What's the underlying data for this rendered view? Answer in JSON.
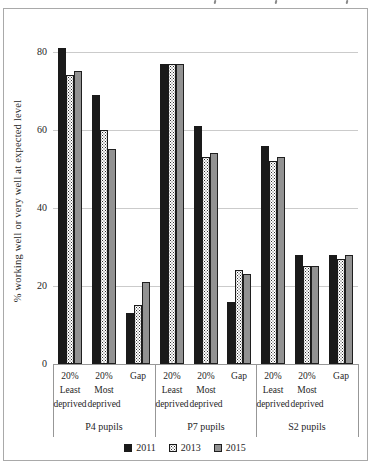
{
  "chart_data": {
    "type": "bar",
    "title": "",
    "ylabel": "% working well or very well at expected level",
    "xlabel": "",
    "y_axis": {
      "ticks": [
        0,
        20,
        40,
        60,
        80
      ],
      "ylim": [
        0,
        85
      ],
      "grid": true
    },
    "groups": [
      {
        "label": "P4 pupils"
      },
      {
        "label": "P7 pupils"
      },
      {
        "label": "S2 pupils"
      }
    ],
    "categories": [
      "20% Least deprived",
      "20% Most deprived",
      "Gap"
    ],
    "category_label_lines": [
      [
        "20%",
        "Least",
        "deprived"
      ],
      [
        "20%",
        "Most",
        "deprived"
      ],
      [
        "Gap"
      ]
    ],
    "series": [
      {
        "name": "2011",
        "fill": "solid-black",
        "values": [
          [
            81,
            69,
            13
          ],
          [
            77,
            61,
            16
          ],
          [
            56,
            28,
            28
          ]
        ]
      },
      {
        "name": "2013",
        "fill": "dotted-white",
        "values": [
          [
            74,
            60,
            15
          ],
          [
            77,
            53,
            24
          ],
          [
            52,
            25,
            27
          ]
        ]
      },
      {
        "name": "2015",
        "fill": "solid-gray",
        "values": [
          [
            75,
            55,
            21
          ],
          [
            77,
            54,
            23
          ],
          [
            53,
            25,
            28
          ]
        ]
      }
    ],
    "legend": {
      "position": "bottom"
    }
  },
  "colors": {
    "series_2011": "#1a1a1a",
    "series_2013_background": "#ffffff",
    "series_2013_dots": "#2f2f2f",
    "series_2015": "#929292",
    "bar_border": "#1a1a1a",
    "gridline": "#cbcbcb",
    "axis": "#979797",
    "text": "#262626",
    "chart_border": "#a9a9a9"
  }
}
